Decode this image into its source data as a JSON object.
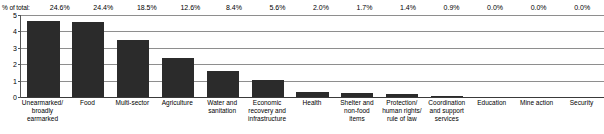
{
  "header": {
    "caption": "% of total:"
  },
  "chart_data": {
    "type": "bar",
    "title": "",
    "subtitle": "",
    "xlabel": "",
    "ylabel": "",
    "ylim": [
      0,
      5
    ],
    "yticks": [
      "0",
      "1",
      "2",
      "3",
      "4",
      "5"
    ],
    "grid": true,
    "legend": "none",
    "orientation": "vertical",
    "bar_color": "#2b2b2b",
    "categories": [
      "Unearmarked/ broadly earmarked",
      "Food",
      "Multi-sector",
      "Agriculture",
      "Water and sanitation",
      "Economic recovery and infrastructure",
      "Health",
      "Shelter and non-food items",
      "Protection/ human rights/ rule of law",
      "Coordination and support services",
      "Education",
      "Mine action",
      "Security"
    ],
    "category_lines": [
      [
        "Unearmarked/",
        "broadly",
        "earmarked"
      ],
      [
        "Food"
      ],
      [
        "Multi-sector"
      ],
      [
        "Agriculture"
      ],
      [
        "Water and",
        "sanitation"
      ],
      [
        "Economic",
        "recovery and",
        "infrastructure"
      ],
      [
        "Health"
      ],
      [
        "Shelter and",
        "non-food",
        "items"
      ],
      [
        "Protection/",
        "human rights/",
        "rule of law"
      ],
      [
        "Coordination",
        "and support",
        "services"
      ],
      [
        "Education"
      ],
      [
        "Mine action"
      ],
      [
        "Security"
      ]
    ],
    "values": [
      4.65,
      4.6,
      3.5,
      2.38,
      1.58,
      1.05,
      0.28,
      0.22,
      0.16,
      0.09,
      0.0,
      0.0,
      0.0
    ],
    "percent_labels": [
      "24.6%",
      "24.4%",
      "18.5%",
      "12.6%",
      "8.4%",
      "5.6%",
      "2.0%",
      "1.7%",
      "1.4%",
      "0.9%",
      "0.0%",
      "0.0%",
      "0.0%"
    ]
  }
}
